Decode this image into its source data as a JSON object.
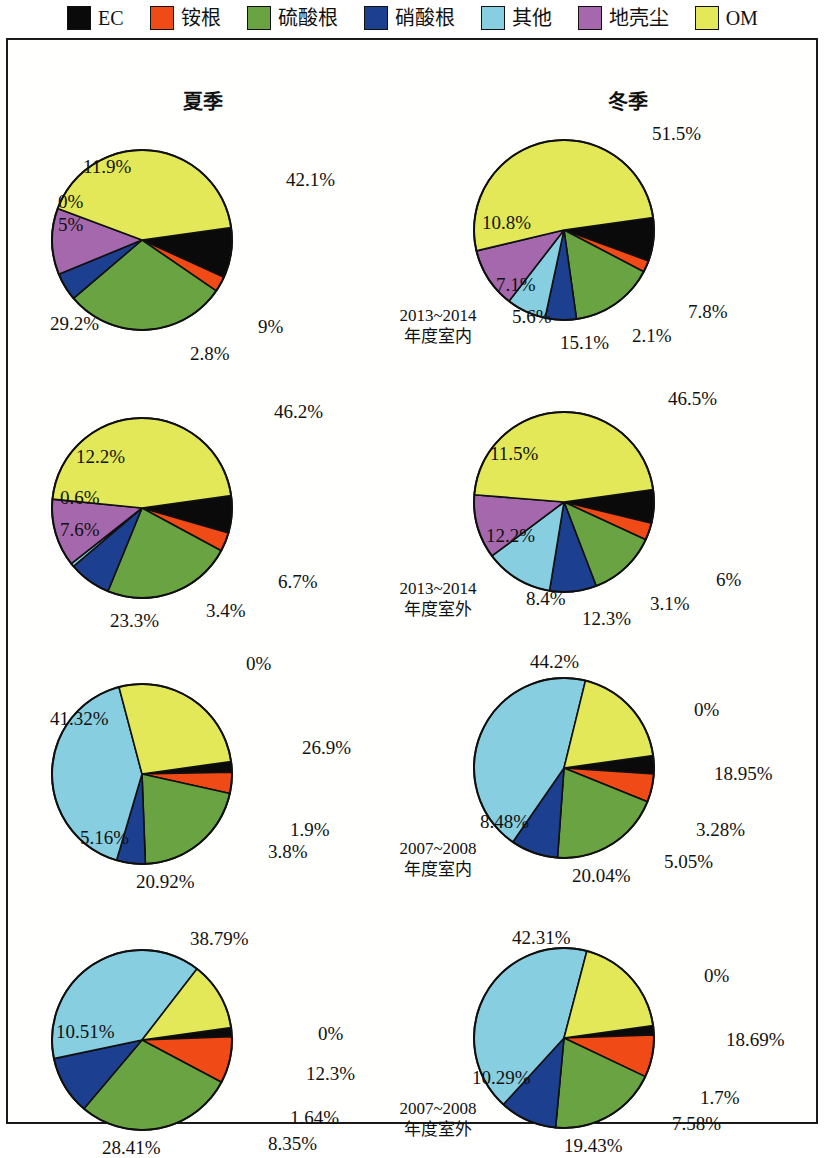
{
  "legend": {
    "items": [
      {
        "label": "EC",
        "color": "#0a0a0a",
        "key": "ec"
      },
      {
        "label": "铵根",
        "color": "#f04a16",
        "key": "nh4"
      },
      {
        "label": "硫酸根",
        "color": "#6aa342",
        "key": "so4"
      },
      {
        "label": "硝酸根",
        "color": "#1c3f8f",
        "key": "no3"
      },
      {
        "label": "其他",
        "color": "#86cee0",
        "key": "other"
      },
      {
        "label": "地壳尘",
        "color": "#a668ac",
        "key": "dust"
      },
      {
        "label": "OM",
        "color": "#e2e857",
        "key": "om"
      }
    ]
  },
  "columns": [
    {
      "label": "夏季"
    },
    {
      "label": "冬季"
    }
  ],
  "rows": [
    {
      "period": "2013~2014",
      "site": "年度室内"
    },
    {
      "period": "2013~2014",
      "site": "年度室外"
    },
    {
      "period": "2007~2008",
      "site": "年度室内"
    },
    {
      "period": "2007~2008",
      "site": "年度室外"
    }
  ],
  "chart_data": {
    "type": "pie",
    "legend_position": "top",
    "categories": [
      "EC",
      "铵根",
      "硫酸根",
      "硝酸根",
      "其他",
      "地壳尘",
      "OM"
    ],
    "colors": [
      "#0a0a0a",
      "#f04a16",
      "#6aa342",
      "#1c3f8f",
      "#86cee0",
      "#a668ac",
      "#e2e857"
    ],
    "units": "%",
    "charts": [
      {
        "id": "summer-2013-indoor",
        "season": "夏季",
        "period": "2013~2014",
        "site": "年度室内",
        "row": 0,
        "col": 0,
        "values": [
          9,
          2.8,
          29.2,
          5,
          0,
          11.9,
          42.1
        ],
        "labels": [
          "9%",
          "2.8%",
          "29.2%",
          "5%",
          "0%",
          "11.9%",
          "42.1%"
        ],
        "label_pos": [
          {
            "t": "9%",
            "x": 208,
            "y": 205
          },
          {
            "t": "2.8%",
            "x": 140,
            "y": 232
          },
          {
            "t": "29.2%",
            "x": 0,
            "y": 202
          },
          {
            "t": "5%",
            "x": 8,
            "y": 103
          },
          {
            "t": "0%",
            "x": 8,
            "y": 80
          },
          {
            "t": "11.9%",
            "x": 33,
            "y": 45
          },
          {
            "t": "42.1%",
            "x": 236,
            "y": 58
          }
        ]
      },
      {
        "id": "winter-2013-indoor",
        "season": "冬季",
        "period": "2013~2014",
        "site": "年度室内",
        "row": 0,
        "col": 1,
        "values": [
          7.8,
          2.1,
          15.1,
          5.6,
          7.1,
          10.8,
          51.5
        ],
        "labels": [
          "7.8%",
          "2.1%",
          "15.1%",
          "5.6%",
          "7.1%",
          "10.8%",
          "51.5%"
        ],
        "label_pos": [
          {
            "t": "7.8%",
            "x": 216,
            "y": 200
          },
          {
            "t": "2.1%",
            "x": 160,
            "y": 224
          },
          {
            "t": "15.1%",
            "x": 88,
            "y": 231
          },
          {
            "t": "5.6%",
            "x": 40,
            "y": 205
          },
          {
            "t": "7.1%",
            "x": 24,
            "y": 173
          },
          {
            "t": "10.8%",
            "x": 10,
            "y": 111
          },
          {
            "t": "51.5%",
            "x": 180,
            "y": 22
          }
        ]
      },
      {
        "id": "summer-2013-outdoor",
        "season": "夏季",
        "period": "2013~2014",
        "site": "年度室外",
        "row": 1,
        "col": 0,
        "values": [
          6.7,
          3.4,
          23.3,
          7.6,
          0.6,
          12.2,
          46.2
        ],
        "labels": [
          "6.7%",
          "3.4%",
          "23.3%",
          "7.6%",
          "0.6%",
          "12.2%",
          "46.2%"
        ],
        "label_pos": [
          {
            "t": "6.7%",
            "x": 228,
            "y": 192
          },
          {
            "t": "3.4%",
            "x": 156,
            "y": 221
          },
          {
            "t": "23.3%",
            "x": 60,
            "y": 231
          },
          {
            "t": "7.6%",
            "x": 10,
            "y": 140
          },
          {
            "t": "0.6%",
            "x": 10,
            "y": 108
          },
          {
            "t": "12.2%",
            "x": 26,
            "y": 67
          },
          {
            "t": "46.2%",
            "x": 224,
            "y": 22
          }
        ]
      },
      {
        "id": "winter-2013-outdoor",
        "season": "冬季",
        "period": "2013~2014",
        "site": "年度室外",
        "row": 1,
        "col": 1,
        "values": [
          6,
          3.1,
          12.3,
          8.4,
          12.2,
          11.5,
          46.5
        ],
        "labels": [
          "6%",
          "3.1%",
          "12.3%",
          "8.4%",
          "12.2%",
          "11.5%",
          "46.5%"
        ],
        "label_pos": [
          {
            "t": "6%",
            "x": 244,
            "y": 196
          },
          {
            "t": "3.1%",
            "x": 178,
            "y": 220
          },
          {
            "t": "12.3%",
            "x": 110,
            "y": 235
          },
          {
            "t": "8.4%",
            "x": 54,
            "y": 215
          },
          {
            "t": "12.2%",
            "x": 14,
            "y": 152
          },
          {
            "t": "11.5%",
            "x": 18,
            "y": 70
          },
          {
            "t": "46.5%",
            "x": 196,
            "y": 15
          }
        ]
      },
      {
        "id": "summer-2007-indoor",
        "season": "夏季",
        "period": "2007~2008",
        "site": "年度室内",
        "row": 2,
        "col": 0,
        "values": [
          1.9,
          3.8,
          20.92,
          5.16,
          41.32,
          0,
          26.9
        ],
        "labels": [
          "1.9%",
          "3.8%",
          "20.92%",
          "5.16%",
          "41.32%",
          "0%",
          "26.9%"
        ],
        "label_pos": [
          {
            "t": "1.9%",
            "x": 240,
            "y": 174
          },
          {
            "t": "3.8%",
            "x": 218,
            "y": 196
          },
          {
            "t": "20.92%",
            "x": 86,
            "y": 226
          },
          {
            "t": "5.16%",
            "x": 30,
            "y": 182
          },
          {
            "t": "41.32%",
            "x": 0,
            "y": 63
          },
          {
            "t": "0%",
            "x": 196,
            "y": 8
          },
          {
            "t": "26.9%",
            "x": 252,
            "y": 92
          }
        ]
      },
      {
        "id": "winter-2007-indoor",
        "season": "冬季",
        "period": "2007~2008",
        "site": "年度室内",
        "row": 2,
        "col": 1,
        "values": [
          3.28,
          5.05,
          20.04,
          8.48,
          44.2,
          0,
          18.95
        ],
        "labels": [
          "3.28%",
          "5.05%",
          "20.04%",
          "8.48%",
          "44.2%",
          "0%",
          "18.95%"
        ],
        "label_pos": [
          {
            "t": "3.28%",
            "x": 224,
            "y": 180
          },
          {
            "t": "5.05%",
            "x": 192,
            "y": 212
          },
          {
            "t": "20.04%",
            "x": 100,
            "y": 226
          },
          {
            "t": "8.48%",
            "x": 8,
            "y": 172
          },
          {
            "t": "44.2%",
            "x": 58,
            "y": 12
          },
          {
            "t": "0%",
            "x": 222,
            "y": 60
          },
          {
            "t": "18.95%",
            "x": 242,
            "y": 124
          }
        ]
      },
      {
        "id": "summer-2007-outdoor",
        "season": "夏季",
        "period": "2007~2008",
        "site": "年度室外",
        "row": 3,
        "col": 0,
        "values": [
          1.64,
          8.35,
          28.41,
          10.51,
          38.79,
          0,
          12.3
        ],
        "labels": [
          "1.64%",
          "8.35%",
          "28.41%",
          "10.51%",
          "38.79%",
          "0%",
          "12.3%"
        ],
        "label_pos": [
          {
            "t": "1.64%",
            "x": 240,
            "y": 196
          },
          {
            "t": "8.35%",
            "x": 218,
            "y": 222
          },
          {
            "t": "28.41%",
            "x": 52,
            "y": 226
          },
          {
            "t": "10.51%",
            "x": 6,
            "y": 110
          },
          {
            "t": "38.79%",
            "x": 140,
            "y": 17
          },
          {
            "t": "0%",
            "x": 268,
            "y": 112
          },
          {
            "t": "12.3%",
            "x": 256,
            "y": 152
          }
        ]
      },
      {
        "id": "winter-2007-outdoor",
        "season": "冬季",
        "period": "2007~2008",
        "site": "年度室外",
        "row": 3,
        "col": 1,
        "values": [
          1.7,
          7.58,
          19.43,
          10.29,
          42.31,
          0,
          18.69
        ],
        "labels": [
          "1.7%",
          "7.58%",
          "19.43%",
          "10.29%",
          "42.31%",
          "0%",
          "18.69%"
        ],
        "label_pos": [
          {
            "t": "1.7%",
            "x": 228,
            "y": 178
          },
          {
            "t": "7.58%",
            "x": 200,
            "y": 204
          },
          {
            "t": "19.43%",
            "x": 92,
            "y": 226
          },
          {
            "t": "10.29%",
            "x": 0,
            "y": 158
          },
          {
            "t": "42.31%",
            "x": 40,
            "y": 18
          },
          {
            "t": "0%",
            "x": 232,
            "y": 56
          },
          {
            "t": "18.69%",
            "x": 254,
            "y": 120
          }
        ]
      }
    ]
  },
  "geometry": {
    "pie_radius": 90,
    "start_angle_deg": -8,
    "block_positions": [
      {
        "left": 42,
        "top": 72
      },
      {
        "left": 464,
        "top": 62
      },
      {
        "left": 42,
        "top": 340
      },
      {
        "left": 464,
        "top": 334
      },
      {
        "left": 42,
        "top": 606
      },
      {
        "left": 464,
        "top": 600
      },
      {
        "left": 42,
        "top": 872
      },
      {
        "left": 464,
        "top": 870
      }
    ],
    "row_label_positions": [
      {
        "left": 345,
        "top": 265
      },
      {
        "left": 345,
        "top": 538
      },
      {
        "left": 345,
        "top": 798
      },
      {
        "left": 345,
        "top": 1058
      }
    ]
  }
}
